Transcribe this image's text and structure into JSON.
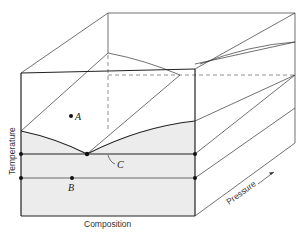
{
  "figure": {
    "type": "3d-phase-diagram",
    "axes": {
      "x": "Composition",
      "y": "Temperature",
      "z": "Pressure"
    },
    "points": [
      {
        "label": "A",
        "x": 71,
        "y": 116
      },
      {
        "label": "B",
        "x": 72,
        "y": 178
      },
      {
        "label": "C",
        "x": 87,
        "y": 154
      }
    ],
    "shading_color": "#ececec",
    "line_color": "#333333"
  }
}
